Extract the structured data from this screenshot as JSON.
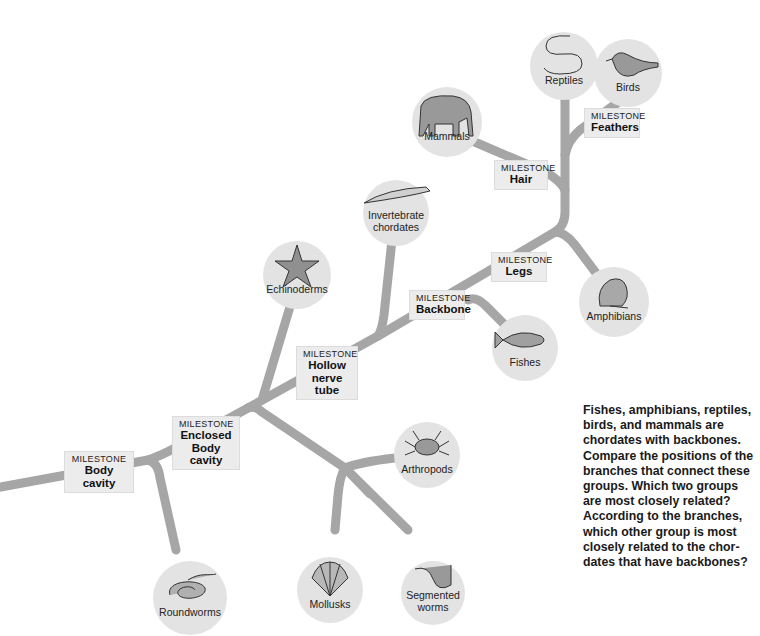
{
  "diagram": {
    "type": "cladogram",
    "milestone_kicker": "MILESTONE",
    "milestones": [
      {
        "id": "body-cavity",
        "title_lines": [
          "Body cavity"
        ]
      },
      {
        "id": "enclosed-body-cavity",
        "title_lines": [
          "Enclosed",
          "Body cavity"
        ]
      },
      {
        "id": "hollow-nerve-tube",
        "title_lines": [
          "Hollow",
          "nerve tube"
        ]
      },
      {
        "id": "backbone",
        "title_lines": [
          "Backbone"
        ]
      },
      {
        "id": "legs",
        "title_lines": [
          "Legs"
        ]
      },
      {
        "id": "hair",
        "title_lines": [
          "Hair"
        ]
      },
      {
        "id": "feathers",
        "title_lines": [
          "Feathers"
        ]
      }
    ],
    "groups": [
      {
        "id": "roundworms",
        "label_lines": [
          "Roundworms"
        ],
        "icon": "roundworm-icon"
      },
      {
        "id": "mollusks",
        "label_lines": [
          "Mollusks"
        ],
        "icon": "scallop-shell-icon"
      },
      {
        "id": "segmented-worms",
        "label_lines": [
          "Segmented",
          "worms"
        ],
        "icon": "segmented-worm-icon"
      },
      {
        "id": "arthropods",
        "label_lines": [
          "Arthropods"
        ],
        "icon": "crab-icon"
      },
      {
        "id": "echinoderms",
        "label_lines": [
          "Echinoderms"
        ],
        "icon": "starfish-icon"
      },
      {
        "id": "invertebrate-chordates",
        "label_lines": [
          "Invertebrate",
          "chordates"
        ],
        "icon": "lancelet-icon"
      },
      {
        "id": "fishes",
        "label_lines": [
          "Fishes"
        ],
        "icon": "fish-icon"
      },
      {
        "id": "amphibians",
        "label_lines": [
          "Amphibians"
        ],
        "icon": "frog-icon"
      },
      {
        "id": "mammals",
        "label_lines": [
          "Mammals"
        ],
        "icon": "elephant-icon"
      },
      {
        "id": "reptiles",
        "label_lines": [
          "Reptiles"
        ],
        "icon": "snake-icon"
      },
      {
        "id": "birds",
        "label_lines": [
          "Birds"
        ],
        "icon": "bird-icon"
      }
    ],
    "caption": "Fishes, amphibians, reptiles, birds, and mammals are chordates with backbones. Compare the positions of the branches that connect these groups. Which two groups are most closely related? According to the branches, which other group is most closely related to the chor­dates that have backbones?",
    "colors": {
      "branch": "#a6a6a6",
      "node_fill": "#e3e3e3",
      "milestone_fill": "#ececec",
      "text": "#1a1a1a"
    }
  }
}
